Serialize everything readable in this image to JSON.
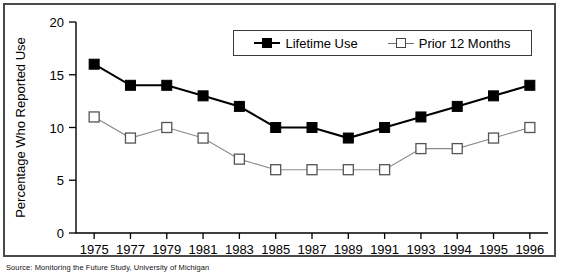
{
  "chart_data": {
    "type": "line",
    "title": "",
    "xlabel": "",
    "ylabel": "Percentage Who Reported Use",
    "ylim": [
      0,
      20
    ],
    "yticks": [
      0,
      5,
      10,
      15,
      20
    ],
    "grid": false,
    "legend_position": "top-right",
    "categories": [
      "1975",
      "1977",
      "1979",
      "1981",
      "1983",
      "1985",
      "1987",
      "1989",
      "1991",
      "1993",
      "1994",
      "1995",
      "1996"
    ],
    "series": [
      {
        "name": "Lifetime Use",
        "marker": "filled-square",
        "color": "#000000",
        "values": [
          16,
          14,
          14,
          13,
          12,
          10,
          10,
          9,
          10,
          11,
          12,
          13,
          14
        ]
      },
      {
        "name": "Prior 12 Months",
        "marker": "open-square",
        "color": "#8a8a8a",
        "values": [
          11,
          9,
          10,
          9,
          7,
          6,
          6,
          6,
          6,
          8,
          8,
          9,
          10
        ]
      }
    ],
    "source_note": "Source: Monitoring the Future Study, University of Michigan"
  },
  "legend": {
    "items": [
      {
        "label": "Lifetime Use",
        "icon": "filled-square-marker"
      },
      {
        "label": "Prior 12 Months",
        "icon": "open-square-marker"
      }
    ]
  }
}
